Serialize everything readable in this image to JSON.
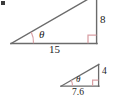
{
  "figure": {
    "background_color": "#ffffff",
    "line_color": "#6b6b6b",
    "accent_color": "#d9a0a5",
    "text_color": "#1a1a1a",
    "width": 116,
    "height": 96
  },
  "triangles": [
    {
      "name": "large-triangle",
      "angle_label": "θ",
      "vertical_leg_label": "8",
      "base_leg_label": "15",
      "has_right_angle_marker": true,
      "right_angle_marker": "∟"
    },
    {
      "name": "small-triangle",
      "angle_label": "θ",
      "vertical_leg_label": "4",
      "base_leg_label": "7.6",
      "has_right_angle_marker": true,
      "right_angle_marker": "∟"
    }
  ],
  "marks": {
    "corner_speck": "scan-artifact"
  }
}
